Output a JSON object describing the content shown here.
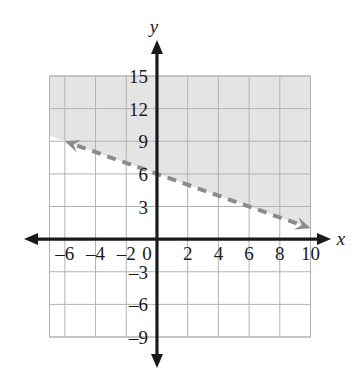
{
  "figure": {
    "kind": "coordinate-plane-inequality-graph",
    "axis_x_label": "x",
    "axis_y_label": "y",
    "axis_color": "#1a1a1a",
    "grid_color": "#b3b3b3",
    "shade_color": "#e4e4e4",
    "line_color": "#8c8c8c",
    "background": "#ffffff"
  },
  "chart_data": {
    "type": "line",
    "title": "",
    "xlabel": "x",
    "ylabel": "y",
    "grid": true,
    "legend": "none",
    "xlim": [
      -7,
      10
    ],
    "ylim": [
      -9,
      15
    ],
    "x_tick_step": 2,
    "y_tick_step": 3,
    "x_ticks": [
      -6,
      -4,
      -2,
      0,
      2,
      4,
      6,
      8,
      10
    ],
    "y_ticks": [
      15,
      12,
      9,
      6,
      3,
      -3,
      -6,
      -9
    ],
    "x_tick_labels": [
      "–6",
      "–4",
      "–2",
      "0",
      "2",
      "4",
      "6",
      "8",
      "10"
    ],
    "y_tick_labels": [
      "15",
      "12",
      "9",
      "6",
      "3",
      "–3",
      "–6",
      "–9"
    ],
    "series": [
      {
        "name": "boundary-line",
        "style": "dashed",
        "arrows": "both",
        "slope": -0.5,
        "y_intercept": 6,
        "points": [
          [
            -6,
            9
          ],
          [
            0,
            6
          ],
          [
            10,
            1
          ]
        ]
      }
    ],
    "shaded_region": {
      "name": "solution-region",
      "side": "above",
      "boundary_included": false,
      "fill": "#e4e4e4",
      "clip_x": [
        -7,
        10
      ],
      "clip_y": [
        -9,
        15
      ]
    }
  }
}
